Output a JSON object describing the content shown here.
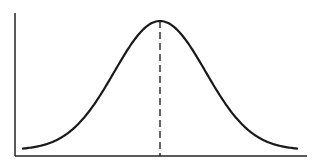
{
  "chart_data": {
    "type": "line",
    "title": "",
    "xlabel": "",
    "ylabel": "",
    "series": [
      {
        "name": "normal-distribution",
        "x": [
          -3,
          -2.5,
          -2,
          -1.5,
          -1,
          -0.5,
          0,
          0.5,
          1,
          1.5,
          2,
          2.5,
          3
        ],
        "values": [
          0.011,
          0.044,
          0.135,
          0.325,
          0.607,
          0.882,
          1.0,
          0.882,
          0.607,
          0.325,
          0.135,
          0.044,
          0.011
        ]
      }
    ],
    "annotations": [
      {
        "type": "vertical-dashed-line",
        "x": 0,
        "label": "mean"
      }
    ],
    "xlim": [
      -3.2,
      3.2
    ],
    "ylim": [
      0,
      1.12
    ],
    "grid": false,
    "legend": "none",
    "tick_labels": false
  },
  "style": {
    "line_color": "#1a1a1a",
    "axis_color": "#222222",
    "background": "#ffffff"
  }
}
